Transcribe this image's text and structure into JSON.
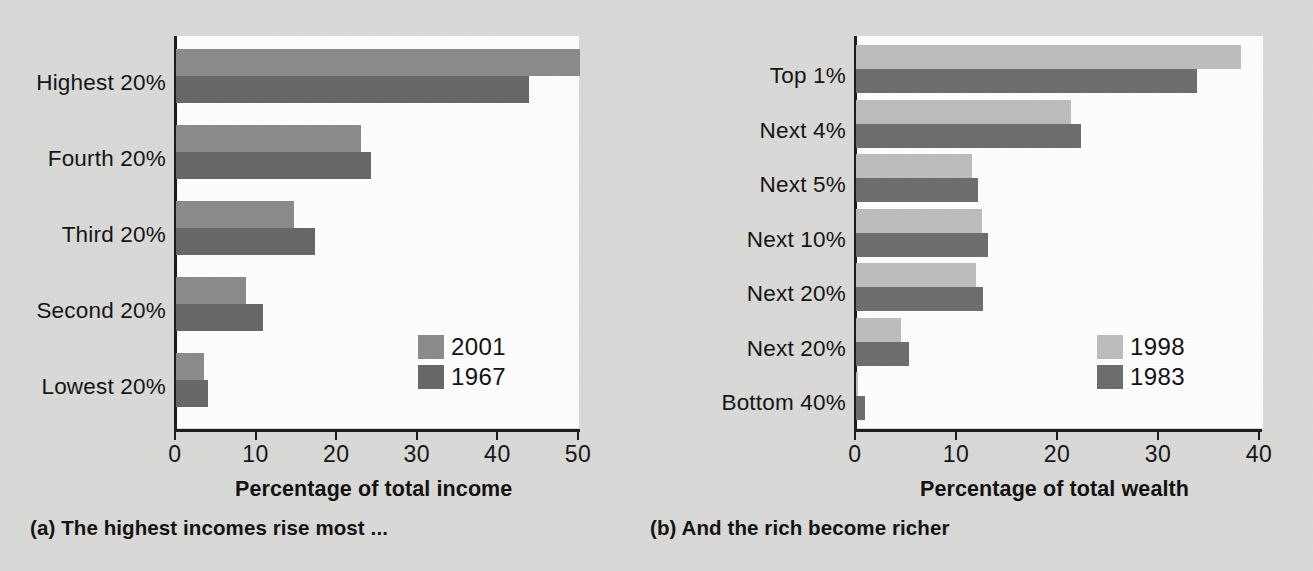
{
  "figure": {
    "background_color": "#d9d9d7",
    "plot_background_color": "#fdfdfd"
  },
  "panel_a": {
    "caption": "(a) The highest incomes rise most ...",
    "axis_title": "Percentage of total income",
    "legend": [
      {
        "label": "2001",
        "color": "#8a8a8a"
      },
      {
        "label": "1967",
        "color": "#676767"
      }
    ],
    "tick_labels": [
      "0",
      "10",
      "20",
      "30",
      "40",
      "50"
    ],
    "categories": [
      "Highest 20%",
      "Fourth 20%",
      "Third 20%",
      "Second 20%",
      "Lowest 20%"
    ]
  },
  "panel_b": {
    "caption": "(b) And the rich become richer",
    "axis_title": "Percentage of total wealth",
    "legend": [
      {
        "label": "1998",
        "color": "#bcbcbc"
      },
      {
        "label": "1983",
        "color": "#6d6d6d"
      }
    ],
    "tick_labels": [
      "0",
      "10",
      "20",
      "30",
      "40"
    ],
    "categories": [
      "Top 1%",
      "Next 4%",
      "Next 5%",
      "Next 10%",
      "Next 20%",
      "Next 20%",
      "Bottom 40%"
    ]
  },
  "chart_data": [
    {
      "type": "bar",
      "orientation": "horizontal",
      "title": "(a) The highest incomes rise most ...",
      "xlabel": "Percentage of total income",
      "ylabel": "",
      "xlim": [
        0,
        50
      ],
      "xticks": [
        0,
        10,
        20,
        30,
        40,
        50
      ],
      "grid": false,
      "legend_position": "inside-bottom-right",
      "categories": [
        "Highest 20%",
        "Fourth 20%",
        "Third 20%",
        "Second 20%",
        "Lowest 20%"
      ],
      "series": [
        {
          "name": "2001",
          "color": "#8a8a8a",
          "values": [
            50.1,
            23.0,
            14.6,
            8.7,
            3.5
          ]
        },
        {
          "name": "1967",
          "color": "#676767",
          "values": [
            43.8,
            24.2,
            17.3,
            10.8,
            4.0
          ]
        }
      ]
    },
    {
      "type": "bar",
      "orientation": "horizontal",
      "title": "(b) And the rich become richer",
      "xlabel": "Percentage of total wealth",
      "ylabel": "",
      "xlim": [
        0,
        40
      ],
      "xticks": [
        0,
        10,
        20,
        30,
        40
      ],
      "grid": false,
      "legend_position": "inside-bottom-right",
      "categories": [
        "Top 1%",
        "Next 4%",
        "Next 5%",
        "Next 10%",
        "Next 20%",
        "Next 20%",
        "Bottom 40%"
      ],
      "series": [
        {
          "name": "1998",
          "color": "#bcbcbc",
          "values": [
            38.1,
            21.3,
            11.5,
            12.5,
            11.9,
            4.5,
            0.2
          ]
        },
        {
          "name": "1983",
          "color": "#6d6d6d",
          "values": [
            33.8,
            22.3,
            12.1,
            13.1,
            12.6,
            5.2,
            0.9
          ]
        }
      ]
    }
  ]
}
